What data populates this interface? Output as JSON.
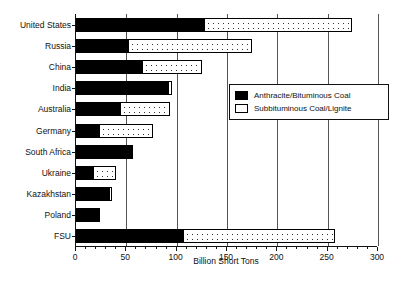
{
  "chart_data": {
    "type": "bar",
    "orientation": "horizontal",
    "stacked": true,
    "title": "",
    "xlabel": "Billion Short Tons",
    "ylabel": "",
    "xlim": [
      0,
      300
    ],
    "xticks": [
      0,
      50,
      100,
      150,
      200,
      250,
      300
    ],
    "xtick_labels": [
      "0",
      "50",
      "100",
      "150",
      "200",
      "250",
      "300"
    ],
    "grid": "vertical",
    "legend_position": "center-right",
    "categories": [
      "United States",
      "Russia",
      "China",
      "India",
      "Australia",
      "Germany",
      "South Africa",
      "Ukraine",
      "Kazakhstan",
      "Poland",
      "FSU"
    ],
    "series": [
      {
        "name": "Anthracite/Bituminous Coal",
        "style": "solid-black",
        "values": [
          128,
          53,
          67,
          92,
          45,
          24,
          57,
          18,
          34,
          23,
          107
        ]
      },
      {
        "name": "Subbituminous Coal/Lignite",
        "style": "dotted-white",
        "values": [
          147,
          123,
          59,
          4,
          49,
          53,
          0,
          23,
          3,
          2,
          151
        ]
      }
    ],
    "totals": [
      275,
      176,
      126,
      96,
      94,
      77,
      57,
      41,
      37,
      25,
      258
    ]
  },
  "legend": {
    "items": [
      {
        "label": "Anthracite/Bituminous Coal",
        "swatch": "black-square-icon"
      },
      {
        "label": "Subbituminous Coal/Lignite",
        "swatch": "dotted-square-icon"
      }
    ]
  },
  "axis": {
    "x_title": "Billion Short Tons"
  }
}
